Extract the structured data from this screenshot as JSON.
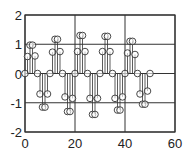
{
  "chart_data": {
    "type": "stem",
    "title": "",
    "xlabel": "",
    "ylabel": "",
    "xlim": [
      0,
      60
    ],
    "ylim": [
      -2,
      2
    ],
    "xticks": [
      0,
      20,
      40,
      60
    ],
    "yticks": [
      -2,
      -1,
      0,
      1,
      2
    ],
    "grid": true,
    "marker": "open-circle",
    "x": [
      0,
      1,
      2,
      3,
      4,
      5,
      6,
      7,
      8,
      9,
      10,
      11,
      12,
      13,
      14,
      15,
      16,
      17,
      18,
      19,
      20,
      21,
      22,
      23,
      24,
      25,
      26,
      27,
      28,
      29,
      30,
      31,
      32,
      33,
      34,
      35,
      36,
      37,
      38,
      39,
      40,
      41,
      42,
      43,
      44,
      45,
      46,
      47,
      48,
      49,
      50
    ],
    "values": [
      0,
      0.58,
      0.97,
      0.97,
      0.6,
      0,
      -0.7,
      -1.15,
      -1.15,
      -0.7,
      0,
      0.73,
      1.17,
      1.17,
      0.75,
      0,
      -0.8,
      -1.3,
      -1.3,
      -0.85,
      0,
      0.75,
      1.3,
      1.3,
      0.75,
      0,
      -0.85,
      -1.4,
      -1.4,
      -0.85,
      0,
      0.75,
      1.27,
      1.27,
      0.75,
      0,
      -0.85,
      -1.25,
      -1.25,
      -0.8,
      0,
      0.7,
      1.1,
      1.1,
      0.65,
      0,
      -0.7,
      -1.05,
      -1.05,
      -0.6,
      0
    ]
  },
  "colors": {
    "line": "#333333",
    "grid": "#333333",
    "frame": "#333333",
    "marker": "#333333"
  }
}
